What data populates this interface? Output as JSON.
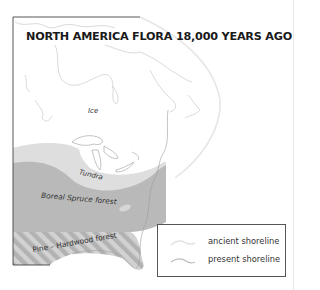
{
  "map": {
    "title": "NORTH AMERICA FLORA 18,000 YEARS AGO",
    "regions": [
      {
        "label": "Ice",
        "fill": "#ffffff"
      },
      {
        "label": "Tundra",
        "fill": "#dedede"
      },
      {
        "label": "Boreal Spruce forest",
        "fill": "#b9b9b9"
      },
      {
        "label": "Pine – Hardwood forest",
        "fill": "hatched #b9b9b9/#d4d4d4"
      }
    ],
    "legend": {
      "items": [
        {
          "label": "ancient shoreline",
          "color": "#e2e2e2"
        },
        {
          "label": "present shoreline",
          "color": "#c8c8c8"
        }
      ]
    },
    "colors": {
      "ice": "#ffffff",
      "tundra": "#dedede",
      "boreal": "#b9b9b9",
      "coastline": "#9a9a9a",
      "frame": "#444444"
    }
  }
}
